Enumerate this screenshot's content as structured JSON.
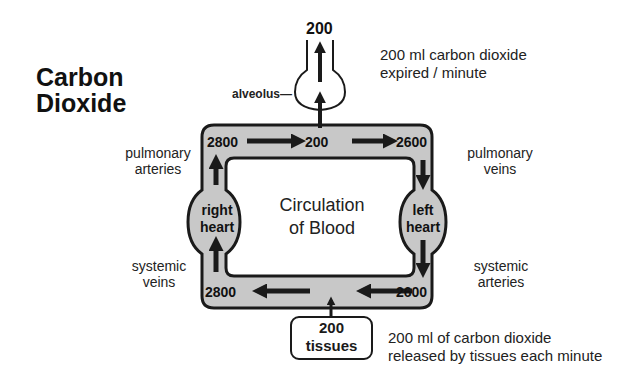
{
  "title": {
    "line1": "Carbon",
    "line2": "Dioxide"
  },
  "colors": {
    "vessel_fill": "#c8c8c8",
    "stroke": "#1a1a1a",
    "background": "#ffffff"
  },
  "expired": {
    "value": "200",
    "note_line1": "200 ml carbon dioxide",
    "note_line2": "expired / minute",
    "alveolus_label": "alveolus—"
  },
  "center": {
    "line1": "Circulation",
    "line2": "of Blood"
  },
  "values": {
    "pulmonary_arteries": "2800",
    "lung_capillaries": "200",
    "pulmonary_veins": "2600",
    "systemic_arteries": "2600",
    "systemic_veins": "2800"
  },
  "labels": {
    "pulmonary_arteries": {
      "line1": "pulmonary",
      "line2": "arteries"
    },
    "pulmonary_veins": {
      "line1": "pulmonary",
      "line2": "veins"
    },
    "systemic_veins": {
      "line1": "systemic",
      "line2": "veins"
    },
    "systemic_arteries": {
      "line1": "systemic",
      "line2": "arteries"
    }
  },
  "hearts": {
    "right": {
      "line1": "right",
      "line2": "heart"
    },
    "left": {
      "line1": "left",
      "line2": "heart"
    }
  },
  "tissues": {
    "value": "200",
    "label": "tissues",
    "note_line1": "200 ml of carbon dioxide",
    "note_line2": "released by tissues each minute"
  }
}
